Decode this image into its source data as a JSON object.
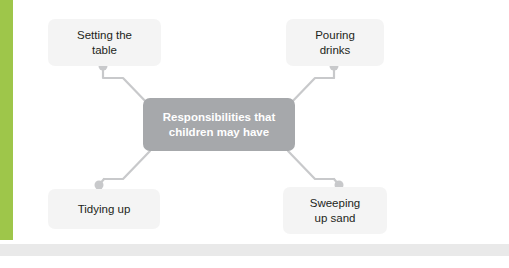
{
  "diagram": {
    "type": "mind-map",
    "center": {
      "label": "Responsibilities that children may have",
      "line1": "Responsibilities that",
      "line2": "children may have",
      "bg_color": "#a6a8ab",
      "text_color": "#ffffff"
    },
    "branches": [
      {
        "id": "setting-the-table",
        "line1": "Setting the",
        "line2": "table",
        "position": "top-left"
      },
      {
        "id": "pouring-drinks",
        "line1": "Pouring",
        "line2": "drinks",
        "position": "top-right"
      },
      {
        "id": "tidying-up",
        "line1": "Tidying up",
        "line2": "",
        "position": "bottom-left"
      },
      {
        "id": "sweeping-up-sand",
        "line1": "Sweeping",
        "line2": "up sand",
        "position": "bottom-right"
      }
    ],
    "accent_color": "#9ec64a",
    "node_color": "#f4f4f4",
    "connector_color": "#c8c9cb"
  }
}
